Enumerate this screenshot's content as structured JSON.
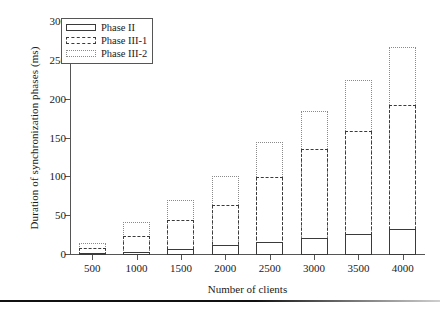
{
  "chart_data": {
    "type": "bar",
    "subtype": "grouped-overlaid-outline",
    "title": "",
    "xlabel": "Number of clients",
    "ylabel": "Duration of synchronization phases (ms)",
    "categories": [
      "500",
      "1000",
      "1500",
      "2000",
      "2500",
      "3000",
      "3500",
      "4000"
    ],
    "series": [
      {
        "name": "Phase II",
        "style": "solid",
        "values": [
          3,
          4,
          8,
          13,
          17,
          22,
          27,
          33
        ]
      },
      {
        "name": "Phase III-1",
        "style": "dashed",
        "values": [
          9,
          25,
          45,
          65,
          100,
          136,
          160,
          193
        ]
      },
      {
        "name": "Phase III-2",
        "style": "dotted",
        "values": [
          15,
          42,
          71,
          102,
          145,
          186,
          225,
          268
        ]
      }
    ],
    "ylim": [
      0,
      300
    ],
    "yticks": [
      0,
      50,
      100,
      150,
      200,
      250,
      300
    ],
    "ytick_labels": [
      "0",
      "50",
      "100",
      "150",
      "200",
      "250",
      "300"
    ],
    "grid": false,
    "legend_position": "top-left",
    "legend_entries": [
      "Phase II",
      "Phase III-1",
      "Phase III-2"
    ],
    "colors": {
      "phase_ii": "#3a3a3a",
      "phase_iii_1": "#3a3a3a",
      "phase_iii_2": "#8a8a8a",
      "axis": "#555555",
      "background": "#ffffff"
    }
  }
}
